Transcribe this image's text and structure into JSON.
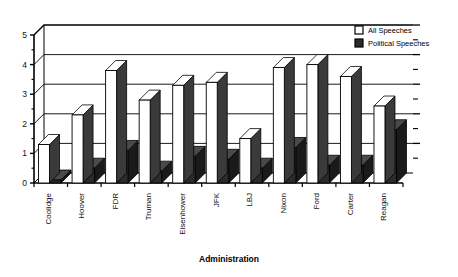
{
  "chart_data": {
    "type": "bar",
    "title": "",
    "subtitle": "",
    "xlabel": "Administration",
    "ylabel": "",
    "ylim": [
      0,
      5
    ],
    "yticks": [
      0,
      1,
      2,
      3,
      4,
      5
    ],
    "ytick_labels": [
      "0",
      "1",
      "2",
      "3",
      "4",
      "5"
    ],
    "minor_ticks": true,
    "grid": true,
    "grid_axis": "y",
    "legend_position": "top-right",
    "style_3d": true,
    "categories": [
      "Coolidge",
      "Hoover",
      "FDR",
      "Truman",
      "Eisenhower",
      "JFK",
      "LBJ",
      "Nixon",
      "Ford",
      "Carter",
      "Reagan"
    ],
    "series": [
      {
        "name": "All Speeches",
        "fill": "#ffffff",
        "values": [
          1.3,
          2.3,
          3.8,
          2.8,
          3.3,
          3.4,
          1.5,
          3.9,
          4.0,
          3.6,
          2.6
        ]
      },
      {
        "name": "Political Speeches",
        "fill": "#2b2b2b",
        "values": [
          0.1,
          0.5,
          1.1,
          0.4,
          0.9,
          0.8,
          0.5,
          1.2,
          0.6,
          0.6,
          1.8
        ]
      }
    ]
  },
  "legend": {
    "items": [
      {
        "label": "All Speeches",
        "swatch": "hollow-square"
      },
      {
        "label": "Political Speeches",
        "swatch": "filled-square"
      }
    ]
  },
  "axes": {
    "x_title": "Administration"
  },
  "colors": {
    "axis": "#000000",
    "grid": "#000000",
    "series_all": "#ffffff",
    "series_political": "#2b2b2b",
    "side_face": "#3a3a3a",
    "background": "#ffffff"
  }
}
